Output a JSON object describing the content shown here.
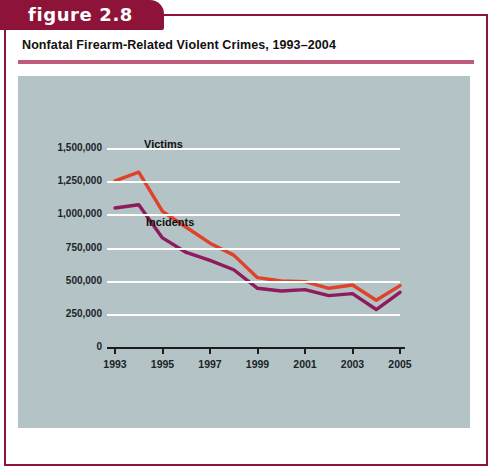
{
  "figure": {
    "tab_label": "figure 2.8",
    "title": "Nonfatal Firearm-Related Violent Crimes, 1993–2004",
    "tab_color": "#8d1438",
    "rule_color": "#c05a79",
    "panel_color": "#b3c3c6",
    "frame_color": "#8d1438"
  },
  "chart_data": {
    "type": "line",
    "title": "Nonfatal Firearm-Related Violent Crimes, 1993–2004",
    "xlabel": "",
    "ylabel": "",
    "x": [
      1993,
      1994,
      1995,
      1996,
      1997,
      1998,
      1999,
      2000,
      2001,
      2002,
      2003,
      2004,
      2005
    ],
    "xlim": [
      1993,
      2005
    ],
    "ylim": [
      0,
      1500000
    ],
    "grid": true,
    "legend_position": "inline-labels",
    "xtick_labels": [
      "1993",
      "1995",
      "1997",
      "1999",
      "2001",
      "2003",
      "2005"
    ],
    "xtick_values": [
      1993,
      1995,
      1997,
      1999,
      2001,
      2003,
      2005
    ],
    "ytick_labels": [
      "0",
      "250,000",
      "500,000",
      "750,000",
      "1,000,000",
      "1,250,000",
      "1,500,000"
    ],
    "ytick_values": [
      0,
      250000,
      500000,
      750000,
      1000000,
      1250000,
      1500000
    ],
    "series": [
      {
        "name": "Victims",
        "color": "#e0412b",
        "values": [
          1260000,
          1325000,
          1030000,
          910000,
          790000,
          700000,
          530000,
          505000,
          500000,
          450000,
          475000,
          360000,
          470000
        ]
      },
      {
        "name": "Incidents",
        "color": "#8e1b5b",
        "values": [
          1055000,
          1080000,
          830000,
          720000,
          660000,
          590000,
          450000,
          430000,
          440000,
          395000,
          410000,
          290000,
          420000
        ]
      }
    ],
    "annotations": [
      {
        "text": "Victims",
        "x": 1993.6,
        "y": 1450000
      },
      {
        "text": "Incidents",
        "x": 1993.7,
        "y": 810000
      }
    ]
  }
}
